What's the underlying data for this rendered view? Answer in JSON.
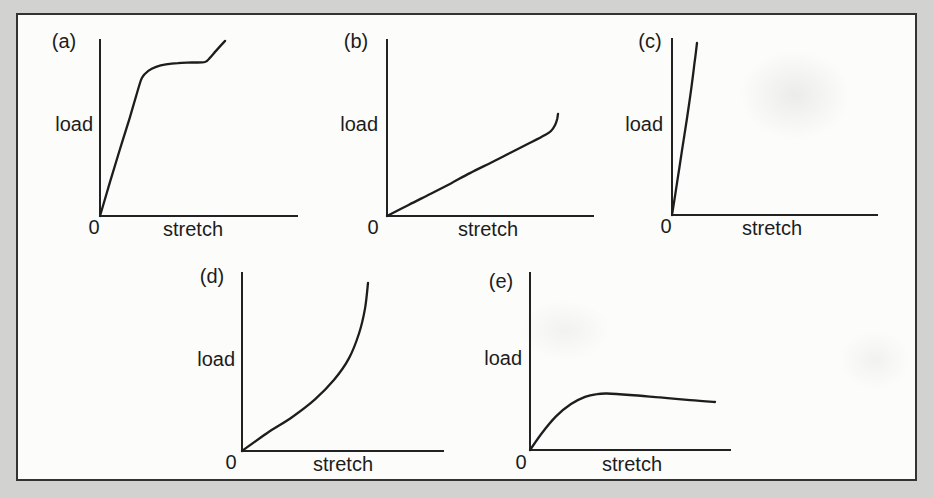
{
  "figure": {
    "background_color": "#d2d2d1",
    "panel_color": "#fcfcfb",
    "border_color": "#333333",
    "line_color": "#1d1d1d"
  },
  "chart_data": [
    {
      "id": "a",
      "type": "line",
      "label": "(a)",
      "xlabel": "stretch",
      "ylabel": "load",
      "origin_label": "0",
      "shape": "rises steeply and linearly from the origin, flattens into a near-horizontal plateau, then turns sharply upward near the end",
      "x_range": [
        0,
        1
      ],
      "y_range": [
        0,
        1
      ],
      "points": [
        [
          0,
          0
        ],
        [
          0.05,
          0.19
        ],
        [
          0.1,
          0.375
        ],
        [
          0.15,
          0.555
        ],
        [
          0.192,
          0.715
        ],
        [
          0.213,
          0.785
        ],
        [
          0.245,
          0.825
        ],
        [
          0.285,
          0.848
        ],
        [
          0.335,
          0.862
        ],
        [
          0.396,
          0.869
        ],
        [
          0.467,
          0.872
        ],
        [
          0.533,
          0.875
        ],
        [
          0.559,
          0.9
        ],
        [
          0.59,
          0.94
        ],
        [
          0.635,
          0.995
        ]
      ]
    },
    {
      "id": "b",
      "type": "line",
      "label": "(b)",
      "xlabel": "stretch",
      "ylabel": "load",
      "origin_label": "0",
      "shape": "long shallow straight line from the origin with a small sharp upturn (hook) at the far end",
      "x_range": [
        0,
        1
      ],
      "y_range": [
        0,
        1
      ],
      "points": [
        [
          0,
          0
        ],
        [
          0.105,
          0.063
        ],
        [
          0.21,
          0.125
        ],
        [
          0.31,
          0.185
        ],
        [
          0.403,
          0.244
        ],
        [
          0.5,
          0.3
        ],
        [
          0.597,
          0.358
        ],
        [
          0.69,
          0.413
        ],
        [
          0.767,
          0.46
        ],
        [
          0.796,
          0.483
        ],
        [
          0.816,
          0.517
        ],
        [
          0.826,
          0.551
        ],
        [
          0.83,
          0.58
        ]
      ]
    },
    {
      "id": "c",
      "type": "line",
      "label": "(c)",
      "xlabel": "stretch",
      "ylabel": "load",
      "origin_label": "0",
      "shape": "very steep, almost vertical straight line close to the load axis, becoming vertical at the top",
      "x_range": [
        0,
        1
      ],
      "y_range": [
        0,
        1
      ],
      "points": [
        [
          0,
          0
        ],
        [
          0.025,
          0.185
        ],
        [
          0.049,
          0.367
        ],
        [
          0.073,
          0.55
        ],
        [
          0.088,
          0.667
        ],
        [
          0.102,
          0.79
        ],
        [
          0.11,
          0.864
        ],
        [
          0.117,
          0.93
        ],
        [
          0.122,
          0.977
        ]
      ]
    },
    {
      "id": "d",
      "type": "line",
      "label": "(d)",
      "xlabel": "stretch",
      "ylabel": "load",
      "origin_label": "0",
      "shape": "curve of ever-increasing slope (exponential-like): shallow at first, rising more and more steeply to nearly vertical",
      "x_range": [
        0,
        1
      ],
      "y_range": [
        0,
        1
      ],
      "points": [
        [
          0,
          0
        ],
        [
          0.124,
          0.1
        ],
        [
          0.249,
          0.19
        ],
        [
          0.363,
          0.29
        ],
        [
          0.458,
          0.4
        ],
        [
          0.532,
          0.52
        ],
        [
          0.582,
          0.66
        ],
        [
          0.612,
          0.8
        ],
        [
          0.627,
          0.944
        ]
      ]
    },
    {
      "id": "e",
      "type": "line",
      "label": "(e)",
      "xlabel": "stretch",
      "ylabel": "load",
      "origin_label": "0",
      "shape": "rises from the origin with decreasing slope to a gentle maximum, then declines slightly",
      "x_range": [
        0,
        1
      ],
      "y_range": [
        0,
        1
      ],
      "points": [
        [
          0,
          0
        ],
        [
          0.06,
          0.096
        ],
        [
          0.13,
          0.19
        ],
        [
          0.205,
          0.26
        ],
        [
          0.275,
          0.3
        ],
        [
          0.335,
          0.316
        ],
        [
          0.385,
          0.319
        ],
        [
          0.5,
          0.311
        ],
        [
          0.65,
          0.297
        ],
        [
          0.8,
          0.282
        ],
        [
          0.925,
          0.271
        ]
      ]
    }
  ]
}
